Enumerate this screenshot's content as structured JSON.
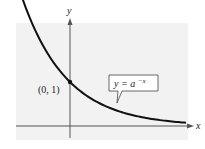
{
  "chart_data": {
    "type": "line",
    "title": "",
    "xlabel": "x",
    "ylabel": "y",
    "series": [
      {
        "name": "y = a^(-x)",
        "function": "a^(-x)",
        "description": "Decreasing exponential curve approaching the x-axis as x increases",
        "x": [
          -1.2,
          -1,
          -0.5,
          0,
          0.5,
          1,
          1.5,
          2,
          2.5,
          3,
          3.5
        ],
        "values": [
          2.29,
          2.0,
          1.41,
          1.0,
          0.71,
          0.5,
          0.35,
          0.25,
          0.18,
          0.13,
          0.09
        ]
      }
    ],
    "annotations": [
      {
        "text": "(0, 1)",
        "x": 0,
        "y": 1,
        "type": "point"
      },
      {
        "text": "y = a^(-x)",
        "type": "callout"
      }
    ],
    "grid": false,
    "legend": "none"
  },
  "labels": {
    "x_axis": "x",
    "y_axis": "y",
    "point": "(0, 1)",
    "equation_base": "y = a",
    "equation_exp": "−x"
  },
  "colors": {
    "background_panel": "#f2f2f2",
    "curve": "#111111",
    "axis": "#555555",
    "text": "#222222",
    "callout_fill": "#ffffff"
  }
}
